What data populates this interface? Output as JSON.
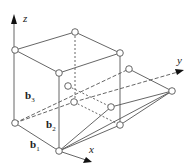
{
  "diagram": {
    "type": "crystal-lattice-unit-cell",
    "axes": {
      "x": "x",
      "y": "y",
      "z": "z"
    },
    "vectors": [
      {
        "name": "b",
        "sub": "1"
      },
      {
        "name": "b",
        "sub": "2"
      },
      {
        "name": "b",
        "sub": "3"
      }
    ],
    "colors": {
      "line": "#555555",
      "node_fill": "#ffffff",
      "node_stroke": "#555555",
      "arrow": "#111111"
    }
  }
}
